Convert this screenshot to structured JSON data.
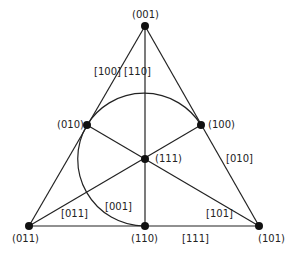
{
  "points": {
    "p001": "(001)",
    "p010": "(010)",
    "p100": "(100)",
    "p111": "(111)",
    "p011": "(011)",
    "p110": "(110)",
    "p101": "(101)"
  },
  "lines": {
    "l100": "[100]",
    "l110": "[110]",
    "l010": "[010]",
    "l001": "[001]",
    "l011": "[011]",
    "l101": "[101]",
    "l111": "[111]"
  }
}
